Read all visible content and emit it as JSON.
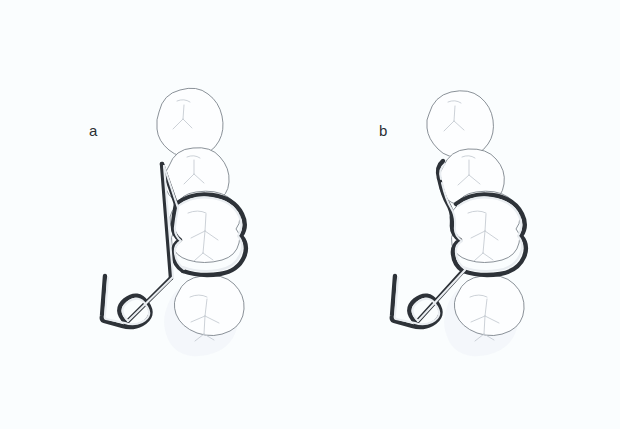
{
  "figure": {
    "background_color": "#fafdfe",
    "width": 620,
    "height": 429,
    "panel_count": 2
  },
  "panels": [
    {
      "id": "a",
      "label": "a",
      "label_x": 89,
      "label_y": 122,
      "caption": "Clasp with long straight vertical retentive arm extending past the second premolar",
      "wire": {
        "color": "#2d3238",
        "highlight_color": "#e9edf1",
        "outer_width": 4.4,
        "inner_width": 2.1,
        "arm_type": "straight-vertical",
        "has_coil": true,
        "coil_turns": 1
      },
      "teeth": [
        {
          "name": "second-premolar-upper",
          "type": "premolar",
          "clasped": false
        },
        {
          "name": "first-premolar-lower",
          "type": "premolar",
          "clasped": false
        },
        {
          "name": "first-molar",
          "type": "molar",
          "clasped": true
        },
        {
          "name": "second-molar",
          "type": "molar",
          "clasped": false
        }
      ]
    },
    {
      "id": "b",
      "label": "b",
      "label_x": 379,
      "label_y": 122,
      "caption": "Clasp with short vertical arm curving mesially over the premolar embrasure",
      "wire": {
        "color": "#2d3238",
        "highlight_color": "#e9edf1",
        "outer_width": 4.4,
        "inner_width": 2.1,
        "arm_type": "curved-hook",
        "has_coil": true,
        "coil_turns": 1
      },
      "teeth": [
        {
          "name": "second-premolar-upper",
          "type": "premolar",
          "clasped": false
        },
        {
          "name": "first-premolar-lower",
          "type": "premolar",
          "clasped": false
        },
        {
          "name": "first-molar",
          "type": "molar",
          "clasped": true
        },
        {
          "name": "second-molar",
          "type": "molar",
          "clasped": false
        }
      ]
    }
  ],
  "colors": {
    "background": "#fafdfe",
    "tooth_outline": "#7d848c",
    "tooth_fill": "#fdfeff",
    "fissure": "#c3c9d0",
    "wire_dark": "#2d3238",
    "wire_light": "#e9edf1",
    "label_text": "#2b2f33"
  }
}
